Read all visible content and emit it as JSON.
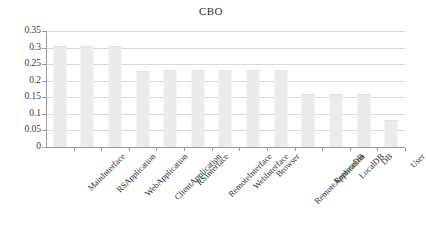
{
  "chart_data": {
    "type": "bar",
    "title": "CBO",
    "xlabel": "",
    "ylabel": "",
    "ylim": [
      0,
      0.35
    ],
    "yticks": [
      0,
      0.05,
      0.1,
      0.15,
      0.2,
      0.25,
      0.3,
      0.35
    ],
    "ytick_labels": [
      "0",
      "0.05",
      "0.1",
      "0.15",
      "0.2",
      "0.25",
      "0.3",
      "0.35"
    ],
    "grid": true,
    "legend": null,
    "categories": [
      "MainInterface",
      "RSApplication",
      "WebApplication",
      "ClientApplication",
      "RSInterface",
      "RemoteInterface",
      "WebInterface",
      "Browser",
      "RemoteApplication",
      "RemoteDB",
      "LocalDB",
      "DB",
      "User"
    ],
    "values": [
      0.305,
      0.305,
      0.305,
      0.229,
      0.231,
      0.231,
      0.231,
      0.231,
      0.233,
      0.16,
      0.16,
      0.16,
      0.082
    ],
    "bar_color": "#ebebeb",
    "gridline_color": "#d9d9d9",
    "axis_color": "#9a9a9a",
    "text_color": "#2e2e2e",
    "label_rotation_deg": -45
  }
}
